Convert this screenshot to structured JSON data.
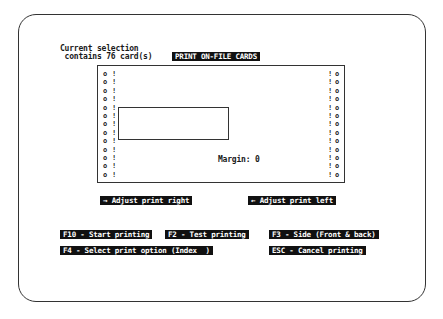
{
  "selection": {
    "line1": "Current selection",
    "line2": " contains 76 card(s)"
  },
  "title": "PRINT ON-FILE CARDS",
  "preview": {
    "hole_glyph": "o",
    "perforation_glyph": "!",
    "rows": 13,
    "margin_label": "Margin: 0"
  },
  "adjust": {
    "right": "→ Adjust print right",
    "left": "← Adjust print left"
  },
  "commands": {
    "start": "F10 - Start printing",
    "test": "F2 - Test printing",
    "side": "F3 - Side (Front & back)",
    "select": "F4 - Select print option (Index  )",
    "cancel": "ESC - Cancel printing"
  },
  "colors": {
    "highlight_bg": "#111111",
    "highlight_fg": "#ffffff",
    "background": "#ffffff"
  }
}
